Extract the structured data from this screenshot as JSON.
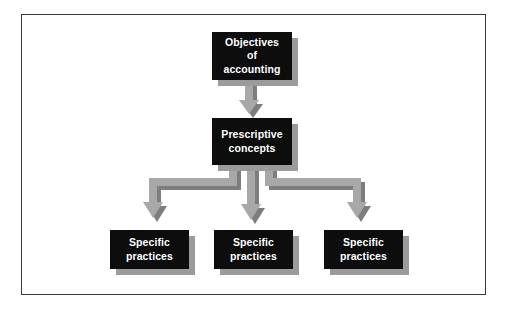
{
  "diagram": {
    "type": "flowchart",
    "orientation": "top-down",
    "frame": {
      "border_color": "#3a3a3a",
      "background": "#ffffff"
    },
    "style": {
      "node_fill": "#0d0d0d",
      "node_text_color": "#ffffff",
      "node_shadow_color": "#9b9b9b",
      "connector_color": "#a8a8a8",
      "connector_shadow_color": "#7d7d7d"
    },
    "nodes": [
      {
        "id": "objectives",
        "lines": [
          "Objectives",
          "of",
          "accounting"
        ],
        "level": 1
      },
      {
        "id": "prescriptive",
        "lines": [
          "Prescriptive",
          "concepts"
        ],
        "level": 2
      },
      {
        "id": "practice_left",
        "lines": [
          "Specific",
          "practices"
        ],
        "level": 3
      },
      {
        "id": "practice_mid",
        "lines": [
          "Specific",
          "practices"
        ],
        "level": 3
      },
      {
        "id": "practice_right",
        "lines": [
          "Specific",
          "practices"
        ],
        "level": 3
      }
    ],
    "connectors": [
      {
        "from": "objectives",
        "to": "prescriptive",
        "shape": "straight-down",
        "arrow": "down"
      },
      {
        "from": "prescriptive",
        "to": "practice_left",
        "shape": "elbow-left",
        "arrow": "down"
      },
      {
        "from": "prescriptive",
        "to": "practice_mid",
        "shape": "straight-down",
        "arrow": "down"
      },
      {
        "from": "prescriptive",
        "to": "practice_right",
        "shape": "elbow-right",
        "arrow": "down"
      }
    ]
  }
}
